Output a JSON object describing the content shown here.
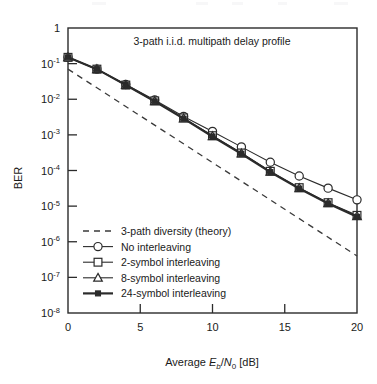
{
  "figure": {
    "annotation": "3-path i.i.d. multipath delay profile",
    "background_color": "#ffffff",
    "ink_color": "#2b2b2b"
  },
  "chart_data": {
    "type": "line",
    "title": "",
    "annotation": "3-path i.i.d. multipath delay profile",
    "xlabel_parts": {
      "prefix": "Average ",
      "e": "E",
      "b": "b",
      "slash": "/",
      "n": "N",
      "zero": "0",
      "unit": " [dB]"
    },
    "xlabel": "Average Eb/N0 [dB]",
    "ylabel": "BER",
    "xlim": [
      0,
      20
    ],
    "ylim": [
      1e-08,
      1
    ],
    "yscale": "log",
    "xticks": [
      0,
      5,
      10,
      15,
      20
    ],
    "xticklabels": [
      "0",
      "5",
      "10",
      "15",
      "20"
    ],
    "yticks": [
      1,
      0.1,
      0.01,
      0.001,
      0.0001,
      1e-05,
      1e-06,
      1e-07,
      1e-08
    ],
    "yticklabels": [
      {
        "mantissa": "1",
        "exponent": ""
      },
      {
        "mantissa": "10",
        "exponent": "-1"
      },
      {
        "mantissa": "10",
        "exponent": "-2"
      },
      {
        "mantissa": "10",
        "exponent": "-3"
      },
      {
        "mantissa": "10",
        "exponent": "-4"
      },
      {
        "mantissa": "10",
        "exponent": "-5"
      },
      {
        "mantissa": "10",
        "exponent": "-6"
      },
      {
        "mantissa": "10",
        "exponent": "-7"
      },
      {
        "mantissa": "10",
        "exponent": "-8"
      }
    ],
    "grid": false,
    "legend_position": "lower-left-inside",
    "x": [
      0,
      2,
      4,
      6,
      8,
      10,
      12,
      14,
      16,
      18,
      20
    ],
    "series": [
      {
        "name": "3-path diversity (theory)",
        "marker": "none",
        "linestyle": "dashed",
        "linewidth": 1.3,
        "x": [
          0,
          20
        ],
        "values": [
          0.07,
          4e-07
        ]
      },
      {
        "name": "No interleaving",
        "marker": "circle-open",
        "linestyle": "solid",
        "linewidth": 1.1,
        "values": [
          0.15,
          0.07,
          0.026,
          0.0095,
          0.0033,
          0.00125,
          0.00046,
          0.00017,
          7e-05,
          3.2e-05,
          1.5e-05
        ]
      },
      {
        "name": "2-symbol interleaving",
        "marker": "square-open",
        "linestyle": "solid",
        "linewidth": 1.1,
        "values": [
          0.15,
          0.07,
          0.025,
          0.009,
          0.003,
          0.00095,
          0.00031,
          9.5e-05,
          3.3e-05,
          1.25e-05,
          5.5e-06
        ]
      },
      {
        "name": "8-symbol interleaving",
        "marker": "triangle-open",
        "linestyle": "solid",
        "linewidth": 1.1,
        "values": [
          0.15,
          0.07,
          0.025,
          0.0088,
          0.0029,
          0.00092,
          0.0003,
          9.2e-05,
          3.2e-05,
          1.2e-05,
          5.2e-06
        ]
      },
      {
        "name": "24-symbol interleaving",
        "marker": "square-filled",
        "linestyle": "solid",
        "linewidth": 2.2,
        "values": [
          0.15,
          0.07,
          0.025,
          0.0087,
          0.00285,
          0.0009,
          0.000295,
          9e-05,
          3.1e-05,
          1.18e-05,
          5e-06
        ]
      }
    ]
  },
  "legend": {
    "entries": [
      {
        "label": "3-path diversity (theory)",
        "marker": "dashed-line"
      },
      {
        "label": "No interleaving",
        "marker": "circle-open"
      },
      {
        "label": "2-symbol interleaving",
        "marker": "square-open"
      },
      {
        "label": "8-symbol interleaving",
        "marker": "triangle-open"
      },
      {
        "label": "24-symbol interleaving",
        "marker": "square-filled"
      }
    ]
  }
}
